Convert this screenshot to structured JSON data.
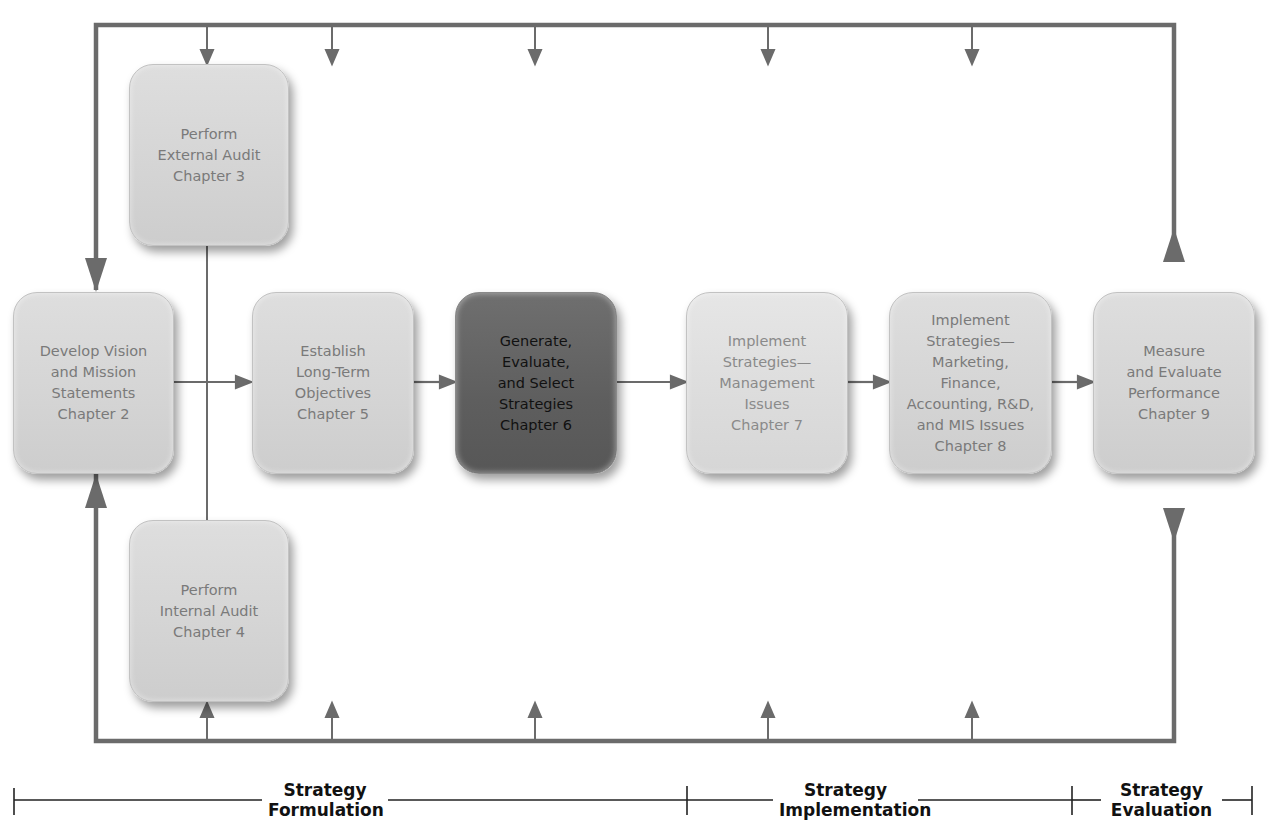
{
  "diagram": {
    "boxes": [
      {
        "id": "develop-vision",
        "label": "Develop Vision\nand Mission\nStatements\nChapter 2",
        "style": "normal"
      },
      {
        "id": "external-audit",
        "label": "Perform\nExternal Audit\nChapter 3",
        "style": "normal"
      },
      {
        "id": "internal-audit",
        "label": "Perform\nInternal Audit\nChapter 4",
        "style": "normal"
      },
      {
        "id": "long-term-objectives",
        "label": "Establish\nLong-Term\nObjectives\nChapter 5",
        "style": "normal"
      },
      {
        "id": "generate-strategies",
        "label": "Generate,\nEvaluate,\nand Select\nStrategies\nChapter 6",
        "style": "highlight"
      },
      {
        "id": "implement-management",
        "label": "Implement\nStrategies—\nManagement\nIssues\nChapter 7",
        "style": "lighter"
      },
      {
        "id": "implement-functional",
        "label": "Implement\nStrategies—\nMarketing,\nFinance,\nAccounting, R&D,\nand MIS Issues\nChapter 8",
        "style": "normal"
      },
      {
        "id": "measure-evaluate",
        "label": "Measure\nand Evaluate\nPerformance\nChapter 9",
        "style": "normal"
      }
    ],
    "flow": [
      "develop-vision -> long-term-objectives",
      "long-term-objectives -> generate-strategies",
      "generate-strategies -> implement-management",
      "implement-management -> implement-functional",
      "implement-functional -> measure-evaluate",
      "measure-evaluate -> feedback-loop (top and bottom)"
    ],
    "phases": [
      {
        "id": "formulation",
        "line1": "Strategy",
        "line2": "Formulation"
      },
      {
        "id": "implementation",
        "line1": "Strategy",
        "line2": "Implementation"
      },
      {
        "id": "evaluation",
        "line1": "Strategy",
        "line2": "Evaluation"
      }
    ],
    "colors": {
      "line": "#6b6b6b",
      "box_fill": "#d8d8d8",
      "box_text": "#7a7a7a",
      "highlight_fill": "#636363",
      "highlight_text": "#111111",
      "phase_text": "#111111"
    }
  }
}
